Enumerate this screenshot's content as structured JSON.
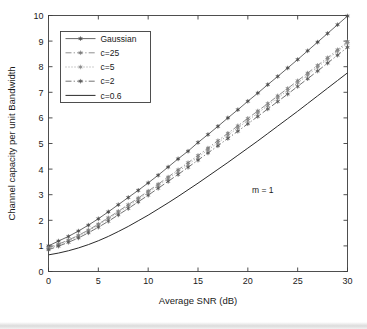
{
  "chart_data": {
    "type": "line",
    "title": "",
    "xlabel": "Average SNR (dB)",
    "ylabel": "Channel capacity per unit Bandwidth",
    "xlim": [
      0,
      30
    ],
    "ylim": [
      0,
      10
    ],
    "xticks": [
      0,
      5,
      10,
      15,
      20,
      25,
      30
    ],
    "yticks": [
      0,
      1,
      2,
      3,
      4,
      5,
      6,
      7,
      8,
      9,
      10
    ],
    "grid": false,
    "legend_position": "upper-left",
    "annotations": [
      {
        "text": "m = 1",
        "x": 21.5,
        "y": 3.05
      }
    ],
    "x": [
      0,
      1,
      2,
      3,
      4,
      5,
      6,
      7,
      8,
      9,
      10,
      11,
      12,
      13,
      14,
      15,
      16,
      17,
      18,
      19,
      20,
      21,
      22,
      23,
      24,
      25,
      26,
      27,
      28,
      29,
      30
    ],
    "series": [
      {
        "name": "Gaussian",
        "style": "solid",
        "marker": "star",
        "color": "#4a4a4a",
        "values": [
          1.0,
          1.19,
          1.37,
          1.58,
          1.81,
          2.06,
          2.33,
          2.61,
          2.89,
          3.17,
          3.46,
          3.76,
          4.08,
          4.4,
          4.7,
          5.04,
          5.35,
          5.67,
          6.0,
          6.32,
          6.65,
          6.97,
          7.3,
          7.62,
          7.95,
          8.28,
          8.62,
          8.96,
          9.3,
          9.64,
          9.98
        ]
      },
      {
        "name": "c=25",
        "style": "dashdot",
        "marker": "star",
        "color": "#7a7a7a",
        "values": [
          0.93,
          1.07,
          1.23,
          1.41,
          1.62,
          1.85,
          2.1,
          2.35,
          2.61,
          2.87,
          3.14,
          3.41,
          3.69,
          3.97,
          4.25,
          4.53,
          4.82,
          5.11,
          5.4,
          5.69,
          5.98,
          6.27,
          6.56,
          6.86,
          7.15,
          7.45,
          7.75,
          8.05,
          8.35,
          8.66,
          8.98
        ]
      },
      {
        "name": "c=5",
        "style": "dotted",
        "marker": "star",
        "color": "#8a8a8a",
        "values": [
          0.9,
          1.04,
          1.2,
          1.38,
          1.58,
          1.81,
          2.05,
          2.3,
          2.55,
          2.81,
          3.08,
          3.35,
          3.62,
          3.9,
          4.18,
          4.46,
          4.75,
          5.03,
          5.32,
          5.61,
          5.9,
          6.19,
          6.48,
          6.78,
          7.07,
          7.37,
          7.67,
          7.98,
          8.29,
          8.6,
          8.92
        ]
      },
      {
        "name": "c=2",
        "style": "dashdot",
        "marker": "star",
        "color": "#5a5a5a",
        "values": [
          0.85,
          0.99,
          1.14,
          1.31,
          1.51,
          1.73,
          1.96,
          2.21,
          2.46,
          2.72,
          2.98,
          3.25,
          3.52,
          3.79,
          4.07,
          4.35,
          4.63,
          4.91,
          5.2,
          5.48,
          5.77,
          6.06,
          6.35,
          6.64,
          6.93,
          7.23,
          7.53,
          7.83,
          8.14,
          8.45,
          8.76
        ]
      },
      {
        "name": "c=0.6",
        "style": "solid",
        "marker": "none",
        "color": "#2a2a2a",
        "values": [
          0.65,
          0.72,
          0.81,
          0.92,
          1.05,
          1.2,
          1.37,
          1.56,
          1.76,
          1.98,
          2.2,
          2.44,
          2.68,
          2.93,
          3.19,
          3.45,
          3.72,
          3.99,
          4.26,
          4.54,
          4.82,
          5.1,
          5.39,
          5.68,
          5.97,
          6.26,
          6.56,
          6.86,
          7.16,
          7.46,
          7.76
        ]
      }
    ],
    "legend_entries": [
      {
        "label": "Gaussian",
        "style": "solid",
        "marker": "star"
      },
      {
        "label": "c=25",
        "style": "dashdot",
        "marker": "star"
      },
      {
        "label": "c=5",
        "style": "dotted",
        "marker": "star"
      },
      {
        "label": "c=2",
        "style": "dashdot",
        "marker": "star"
      },
      {
        "label": "c=0.6",
        "style": "solid",
        "marker": "none"
      }
    ]
  },
  "colors": {
    "axis": "#3c3c3c",
    "text": "#1a1a1a",
    "background": "#ffffff"
  }
}
